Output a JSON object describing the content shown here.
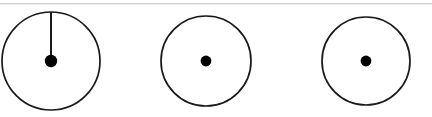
{
  "figure": {
    "canvas": {
      "width": 432,
      "height": 117
    },
    "background_color": "#ffffff",
    "stroke_color": "#1a1a1a",
    "fill_color": "#000000",
    "artifact_color": "#c9c9c9",
    "count_label": "3",
    "items": [
      {
        "name": "circle-with-radius",
        "cx": 51,
        "cy": 61,
        "r": 49,
        "stroke_width": 1.7,
        "dot_r": 6.2,
        "has_radius_line": true,
        "radius_line": {
          "x1": 51,
          "y1": 61,
          "x2": 51,
          "y2": 12,
          "width": 2.0,
          "angle_deg": 90,
          "direction": "up"
        }
      },
      {
        "name": "plain-circle-middle",
        "cx": 206,
        "cy": 61,
        "r": 45,
        "stroke_width": 1.7,
        "dot_r": 5.4,
        "has_radius_line": false,
        "radius_line": null
      },
      {
        "name": "plain-circle-right",
        "cx": 366,
        "cy": 61,
        "r": 44,
        "stroke_width": 1.7,
        "dot_r": 5.4,
        "has_radius_line": false,
        "radius_line": null
      }
    ]
  }
}
